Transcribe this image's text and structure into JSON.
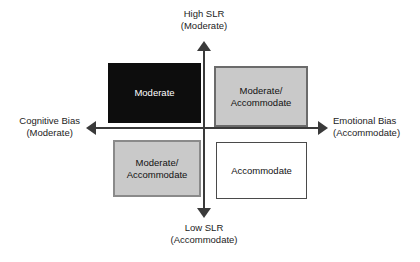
{
  "axes": {
    "vertical": {
      "top": {
        "primary": "High SLR",
        "secondary": "(Moderate)"
      },
      "bottom": {
        "primary": "Low SLR",
        "secondary": "(Accommodate)"
      }
    },
    "horizontal": {
      "left": {
        "primary": "Cognitive Bias",
        "secondary": "(Moderate)"
      },
      "right": {
        "primary": "Emotional Bias",
        "secondary": "(Accommodate)"
      }
    }
  },
  "quadrants": {
    "top_left": {
      "line1": "Moderate",
      "line2": "",
      "fill": "#0d0d0d",
      "text_color": "#ffffff"
    },
    "top_right": {
      "line1": "Moderate/",
      "line2": "Accommodate",
      "fill": "#c9c9c9",
      "text_color": "#111111"
    },
    "bottom_left": {
      "line1": "Moderate/",
      "line2": "Accommodate",
      "fill": "#c9c9c9",
      "text_color": "#111111"
    },
    "bottom_right": {
      "line1": "Accommodate",
      "line2": "",
      "fill": "#ffffff",
      "text_color": "#111111"
    }
  },
  "chart_data": {
    "type": "table",
    "xlabel": "Cognitive Bias (Moderate) ↔ Emotional Bias (Accommodate)",
    "ylabel": "Low SLR (Accommodate) ↔ High SLR (Moderate)",
    "x_axis_poles": [
      "Cognitive Bias (Moderate)",
      "Emotional Bias (Accommodate)"
    ],
    "y_axis_poles": [
      "Low SLR (Accommodate)",
      "High SLR (Moderate)"
    ],
    "categories": [
      "Top Left",
      "Top Right",
      "Bottom Left",
      "Bottom Right"
    ],
    "cells": [
      {
        "quadrant": "Top Left",
        "x": "Cognitive Bias",
        "y": "High SLR",
        "label": "Moderate",
        "fill": "#0d0d0d",
        "text_color": "#ffffff"
      },
      {
        "quadrant": "Top Right",
        "x": "Emotional Bias",
        "y": "High SLR",
        "label": "Moderate/Accommodate",
        "fill": "#c9c9c9",
        "text_color": "#111111"
      },
      {
        "quadrant": "Bottom Left",
        "x": "Cognitive Bias",
        "y": "Low SLR",
        "label": "Moderate/Accommodate",
        "fill": "#c9c9c9",
        "text_color": "#111111"
      },
      {
        "quadrant": "Bottom Right",
        "x": "Emotional Bias",
        "y": "Low SLR",
        "label": "Accommodate",
        "fill": "#ffffff",
        "text_color": "#111111"
      }
    ],
    "grid": false,
    "legend": "none"
  }
}
